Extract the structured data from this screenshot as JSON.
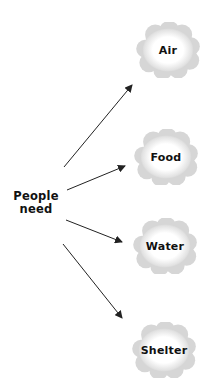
{
  "diagram": {
    "source": {
      "line1": "People",
      "line2": "need",
      "x": 36,
      "y": 203
    },
    "targets": [
      {
        "label": "Air",
        "cx": 168,
        "cy": 50,
        "w": 64,
        "h": 56
      },
      {
        "label": "Food",
        "cx": 166,
        "cy": 157,
        "w": 66,
        "h": 56
      },
      {
        "label": "Water",
        "cx": 165,
        "cy": 246,
        "w": 66,
        "h": 56
      },
      {
        "label": "Shelter",
        "cx": 164,
        "cy": 350,
        "w": 68,
        "h": 56
      }
    ],
    "arrows": [
      {
        "x1": 64,
        "y1": 167,
        "x2": 132,
        "y2": 85
      },
      {
        "x1": 67,
        "y1": 190,
        "x2": 125,
        "y2": 166
      },
      {
        "x1": 66,
        "y1": 220,
        "x2": 122,
        "y2": 242
      },
      {
        "x1": 63,
        "y1": 244,
        "x2": 122,
        "y2": 318
      }
    ],
    "colors": {
      "arrow": "#222222",
      "cloud_edge": "#bdbdbd",
      "cloud_fill": "#ffffff",
      "text": "#111111"
    }
  }
}
